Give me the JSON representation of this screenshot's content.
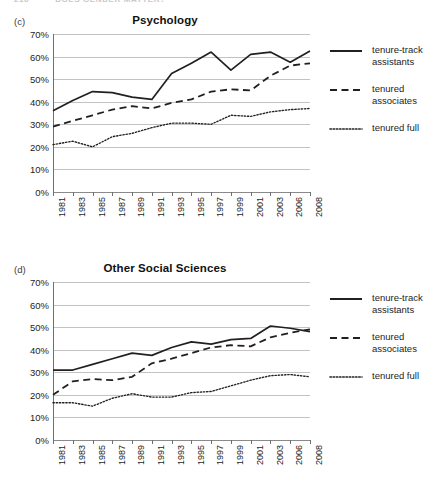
{
  "running_head": {
    "page_number": "216",
    "text": "DOES GENDER MATTER?",
    "visible": "partially-clipped"
  },
  "legend": {
    "position": "right",
    "entries": [
      {
        "label": "tenure-track\nassistants",
        "line1": "tenure-track",
        "line2": "assistants",
        "style": "solid"
      },
      {
        "label": "tenured\nassociates",
        "line1": "tenured",
        "line2": "associates",
        "style": "dashed"
      },
      {
        "label": "tenured full",
        "line1": "tenured full",
        "line2": "",
        "style": "dotted"
      }
    ]
  },
  "axis": {
    "y_ticks": [
      "0%",
      "10%",
      "20%",
      "30%",
      "40%",
      "50%",
      "60%",
      "70%"
    ],
    "y_values": [
      0,
      10,
      20,
      30,
      40,
      50,
      60,
      70
    ],
    "x_ticks": [
      "1981",
      "1983",
      "1985",
      "1987",
      "1989",
      "1991",
      "1993",
      "1995",
      "1997",
      "1999",
      "2001",
      "2003",
      "2006",
      "2008"
    ]
  },
  "colors": {
    "line": "#231f20",
    "grid": "#c3c3c3",
    "axis": "#6f6f6f",
    "text": "#1d1d1d",
    "background": "#ffffff"
  },
  "panels": [
    {
      "letter": "(c)",
      "title": "Psychology"
    },
    {
      "letter": "(d)",
      "title": "Other Social Sciences"
    }
  ],
  "chart_data": [
    {
      "type": "line",
      "panel": "(c)",
      "title": "Psychology",
      "xlabel": "",
      "ylabel": "",
      "ylim": [
        0,
        70
      ],
      "grid": true,
      "legend_position": "right",
      "categories": [
        "1981",
        "1983",
        "1985",
        "1987",
        "1989",
        "1991",
        "1993",
        "1995",
        "1997",
        "1999",
        "2001",
        "2003",
        "2006",
        "2008"
      ],
      "series": [
        {
          "name": "tenure-track assistants",
          "style": "solid",
          "values": [
            36.0,
            40.5,
            44.5,
            44.0,
            42.0,
            41.0,
            52.5,
            57.0,
            62.0,
            54.0,
            61.0,
            62.0,
            57.5,
            62.5
          ]
        },
        {
          "name": "tenured associates",
          "style": "dashed",
          "values": [
            29.0,
            31.5,
            34.0,
            36.5,
            38.0,
            37.0,
            39.5,
            41.0,
            44.5,
            45.5,
            45.0,
            51.5,
            56.0,
            57.0
          ]
        },
        {
          "name": "tenured full",
          "style": "dotted",
          "values": [
            21.0,
            22.5,
            20.0,
            24.5,
            26.0,
            28.5,
            30.5,
            30.5,
            30.0,
            34.0,
            33.5,
            35.5,
            36.5,
            37.0
          ]
        }
      ]
    },
    {
      "type": "line",
      "panel": "(d)",
      "title": "Other Social Sciences",
      "xlabel": "",
      "ylabel": "",
      "ylim": [
        0,
        70
      ],
      "grid": true,
      "legend_position": "right",
      "categories": [
        "1981",
        "1983",
        "1985",
        "1987",
        "1989",
        "1991",
        "1993",
        "1995",
        "1997",
        "1999",
        "2001",
        "2003",
        "2006",
        "2008"
      ],
      "series": [
        {
          "name": "tenure-track assistants",
          "style": "solid",
          "values": [
            31.0,
            31.0,
            33.5,
            36.0,
            38.5,
            37.5,
            41.0,
            43.5,
            42.5,
            44.5,
            45.0,
            50.5,
            49.5,
            48.0
          ]
        },
        {
          "name": "tenured associates",
          "style": "dashed",
          "values": [
            20.0,
            26.0,
            27.0,
            26.5,
            28.0,
            34.0,
            36.0,
            38.5,
            41.0,
            42.0,
            41.5,
            45.5,
            47.5,
            49.0
          ]
        },
        {
          "name": "tenured full",
          "style": "dotted",
          "values": [
            16.5,
            16.5,
            15.0,
            18.5,
            20.5,
            19.0,
            19.0,
            21.0,
            21.5,
            24.0,
            26.5,
            28.5,
            29.0,
            28.0
          ]
        }
      ]
    }
  ]
}
